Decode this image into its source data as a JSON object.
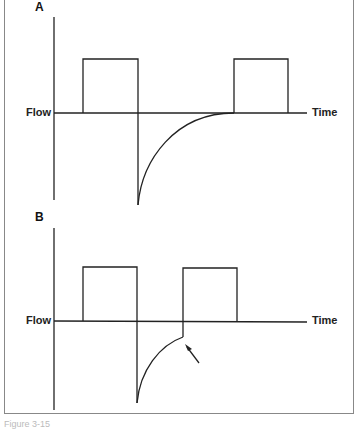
{
  "panels": [
    {
      "label": "A",
      "y_axis_label": "Flow",
      "x_axis_label": "Time"
    },
    {
      "label": "B",
      "y_axis_label": "Flow",
      "x_axis_label": "Time"
    }
  ],
  "caption": "Figure 3-15"
}
